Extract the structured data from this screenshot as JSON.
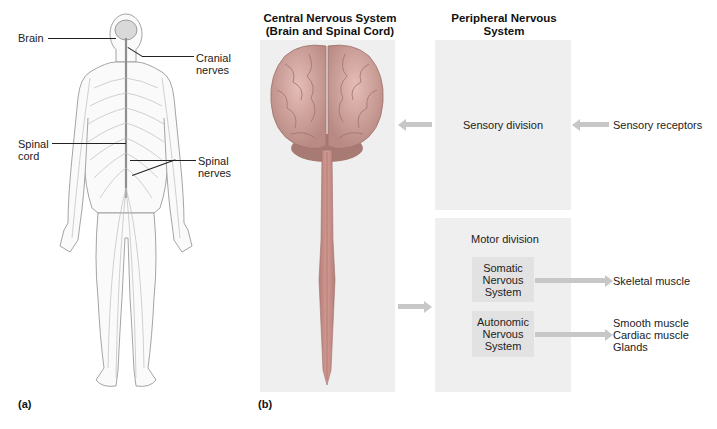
{
  "figure_a": {
    "panel_label": "(a)",
    "labels": {
      "brain": "Brain",
      "cranial_nerves": [
        "Cranial",
        "nerves"
      ],
      "spinal_cord": [
        "Spinal",
        "cord"
      ],
      "spinal_nerves": [
        "Spinal",
        "nerves"
      ]
    }
  },
  "figure_b": {
    "panel_label": "(b)",
    "cns": {
      "title": [
        "Central Nervous System",
        "(Brain and Spinal Cord)"
      ]
    },
    "pns": {
      "title": [
        "Peripheral Nervous System",
        "(Cranial and Spinal Nerves)"
      ],
      "sensory_division": "Sensory division",
      "sensory_input": "Sensory receptors",
      "motor_division": "Motor division",
      "somatic": [
        "Somatic",
        "Nervous",
        "System"
      ],
      "autonomic": [
        "Autonomic",
        "Nervous",
        "System"
      ],
      "somatic_target": "Skeletal muscle",
      "autonomic_targets": [
        "Smooth muscle",
        "Cardiac muscle",
        "Glands"
      ]
    }
  },
  "colors": {
    "panel_bg": "#efefef",
    "subbox_bg": "#e2e2e2",
    "arrow": "#c7c7c7",
    "brain": "#d8a7a0",
    "spinal_cord": "#c98c86"
  }
}
